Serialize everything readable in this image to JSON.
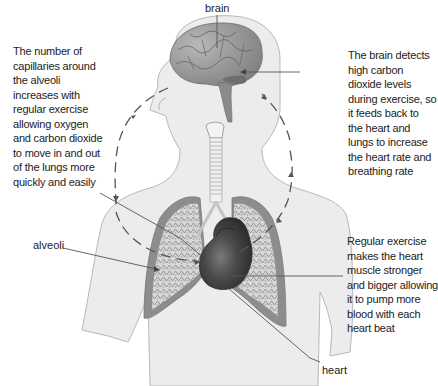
{
  "diagram": {
    "labels": {
      "brain": "brain",
      "alveoli": "alveoli",
      "heart": "heart"
    },
    "annotations": {
      "lungs_capillaries": [
        "The number of",
        "capillaries around",
        "the alveoli",
        "increases with",
        "regular exercise",
        "allowing oxygen",
        "and carbon dioxide",
        "to move in and out",
        "of the lungs more",
        "quickly and easily"
      ],
      "brain_feedback": [
        "The brain detects",
        "high carbon",
        "dioxide levels",
        "during exercise, so",
        "it feeds back to",
        "the heart and",
        "lungs to increase",
        "the heart rate and",
        "breathing rate"
      ],
      "heart_muscle": [
        "Regular exercise",
        "makes the heart",
        "muscle stronger",
        "and bigger allowing",
        "it to pump more",
        "blood with each",
        "heart beat"
      ]
    },
    "colors": {
      "body_fill": "#ececec",
      "body_outline": "#b5b5b5",
      "brain": "#8f8f8f",
      "lung_outer": "#8a8a8a",
      "lung_inner": "#d6d6d6",
      "heart": "#3e3e3e",
      "leader_line": "#444444",
      "cycle_arrow": "#555555"
    }
  }
}
